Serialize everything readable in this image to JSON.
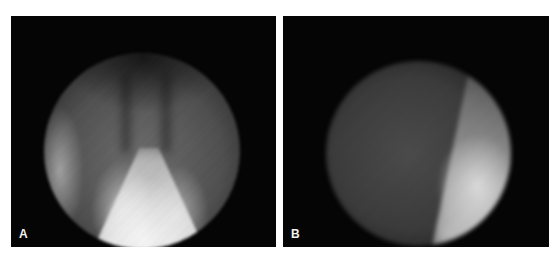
{
  "figure": {
    "panels": [
      {
        "label": "A",
        "content": "grayscale circular fluoroscopic view with bright triangular wedge at bottom center and dark vertical bands at top"
      },
      {
        "label": "B",
        "content": "grayscale circular fluoroscopic view with diffuse gray left region and bright area at lower right"
      }
    ],
    "colors": {
      "background": "#ffffff",
      "panel_background": "#050505",
      "label_color": "#f2f2f2"
    }
  }
}
